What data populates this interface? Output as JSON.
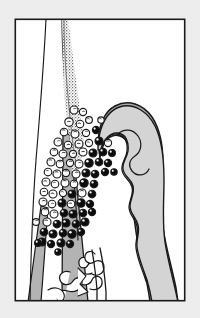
{
  "figure": {
    "type": "scientific-illustration",
    "subtype": "histology-schematic",
    "title": "",
    "caption": "",
    "canvas": {
      "width": 200,
      "height": 318
    },
    "background_color": "#ededed",
    "frame": {
      "name": "figure-border",
      "x": 14.5,
      "y": 18.5,
      "width": 171,
      "height": 283,
      "stroke_color": "#1a1a1a",
      "stroke_width": 1.6,
      "fill_color": "#ffffff"
    },
    "palette": {
      "background": "#ededed",
      "panel_fill": "#ffffff",
      "tissue_light_gray": "#d4d4d4",
      "tissue_mid_gray": "#a9a9a9",
      "tissue_band_gray": "#b3b3b3",
      "outline_dark": "#1a1a1a",
      "cell_dark_fill": "#0d0d0d",
      "cell_open_fill": "#ffffff",
      "cell_highlight": "#ffffff",
      "stipple_color": "#4a4a4a"
    },
    "structures": [
      {
        "name": "epithelial-margin-line-outer",
        "kind": "thin-curve",
        "description": "slender near-vertical boundary line at upper left",
        "stroke_color": "#1a1a1a",
        "stroke_width": 1.1
      },
      {
        "name": "epithelial-margin-line-inner",
        "kind": "thin-curve",
        "description": "second slender boundary line running parallel, slightly right",
        "stroke_color": "#1a1a1a",
        "stroke_width": 1.1
      },
      {
        "name": "stippled-basement-band",
        "kind": "stippled-band",
        "description": "granular stippled diagonal band descending from top to mid-left",
        "color": "#4a4a4a"
      },
      {
        "name": "gray-stromal-band-left",
        "kind": "filled-band",
        "description": "mid-gray band continuing downward along the left toward panel base",
        "fill_color": "#b3b3b3"
      },
      {
        "name": "tissue-mass-outer-zone",
        "kind": "filled-region",
        "description": "dark gray outer rim of the large right-hand tissue mass",
        "fill_color": "#a9a9a9"
      },
      {
        "name": "tissue-mass-inner-zone",
        "kind": "filled-region",
        "description": "light gray scalloped inner core of the tissue mass",
        "fill_color": "#d4d4d4"
      },
      {
        "name": "basal-branching-structure",
        "kind": "outline-network",
        "description": "irregular branching outlined network at panel base",
        "stroke_color": "#1a1a1a",
        "fill_color": "#ffffff"
      }
    ],
    "cell_legend": [
      {
        "key": "open-cell",
        "label": "unlabelled / open cell",
        "fill": "#ffffff",
        "ring": "#1a1a1a"
      },
      {
        "key": "dark-cell",
        "label": "labelled / dense cell",
        "fill": "#0d0d0d",
        "ring": "#000000"
      }
    ],
    "cell_counts": {
      "open_cells": 40,
      "dark_cells": 38,
      "total": 78
    },
    "cells": [
      {
        "x": 74,
        "y": 110,
        "r": 4.0,
        "type": "open"
      },
      {
        "x": 83,
        "y": 112,
        "r": 3.6,
        "type": "open"
      },
      {
        "x": 69,
        "y": 122,
        "r": 4.2,
        "type": "open"
      },
      {
        "x": 80,
        "y": 124,
        "r": 3.8,
        "type": "open"
      },
      {
        "x": 89,
        "y": 120,
        "r": 3.4,
        "type": "open"
      },
      {
        "x": 64,
        "y": 132,
        "r": 3.8,
        "type": "open"
      },
      {
        "x": 75,
        "y": 134,
        "r": 4.0,
        "type": "open"
      },
      {
        "x": 86,
        "y": 133,
        "r": 3.6,
        "type": "open"
      },
      {
        "x": 58,
        "y": 142,
        "r": 4.0,
        "type": "open"
      },
      {
        "x": 68,
        "y": 145,
        "r": 3.8,
        "type": "open"
      },
      {
        "x": 79,
        "y": 144,
        "r": 4.0,
        "type": "open"
      },
      {
        "x": 89,
        "y": 143,
        "r": 3.6,
        "type": "open"
      },
      {
        "x": 99,
        "y": 141,
        "r": 4.0,
        "type": "dark"
      },
      {
        "x": 108,
        "y": 143,
        "r": 3.6,
        "type": "open"
      },
      {
        "x": 54,
        "y": 152,
        "r": 3.8,
        "type": "open"
      },
      {
        "x": 63,
        "y": 154,
        "r": 4.0,
        "type": "open"
      },
      {
        "x": 73,
        "y": 154,
        "r": 3.6,
        "type": "open"
      },
      {
        "x": 83,
        "y": 152,
        "r": 4.0,
        "type": "open"
      },
      {
        "x": 93,
        "y": 153,
        "r": 4.0,
        "type": "dark"
      },
      {
        "x": 103,
        "y": 152,
        "r": 3.8,
        "type": "dark"
      },
      {
        "x": 51,
        "y": 162,
        "r": 4.0,
        "type": "open"
      },
      {
        "x": 60,
        "y": 164,
        "r": 3.8,
        "type": "open"
      },
      {
        "x": 70,
        "y": 163,
        "r": 3.6,
        "type": "open"
      },
      {
        "x": 79,
        "y": 164,
        "r": 4.0,
        "type": "open"
      },
      {
        "x": 89,
        "y": 163,
        "r": 4.2,
        "type": "dark"
      },
      {
        "x": 99,
        "y": 162,
        "r": 3.8,
        "type": "dark"
      },
      {
        "x": 108,
        "y": 163,
        "r": 3.6,
        "type": "dark"
      },
      {
        "x": 48,
        "y": 172,
        "r": 3.8,
        "type": "open"
      },
      {
        "x": 57,
        "y": 174,
        "r": 4.0,
        "type": "open"
      },
      {
        "x": 66,
        "y": 173,
        "r": 3.6,
        "type": "open"
      },
      {
        "x": 76,
        "y": 174,
        "r": 4.0,
        "type": "open"
      },
      {
        "x": 86,
        "y": 173,
        "r": 4.0,
        "type": "dark"
      },
      {
        "x": 95,
        "y": 174,
        "r": 3.8,
        "type": "dark"
      },
      {
        "x": 105,
        "y": 172,
        "r": 3.6,
        "type": "dark"
      },
      {
        "x": 46,
        "y": 182,
        "r": 4.0,
        "type": "open"
      },
      {
        "x": 55,
        "y": 184,
        "r": 3.8,
        "type": "open"
      },
      {
        "x": 65,
        "y": 183,
        "r": 4.0,
        "type": "open"
      },
      {
        "x": 74,
        "y": 184,
        "r": 3.8,
        "type": "open"
      },
      {
        "x": 84,
        "y": 183,
        "r": 4.2,
        "type": "dark"
      },
      {
        "x": 94,
        "y": 184,
        "r": 3.8,
        "type": "dark"
      },
      {
        "x": 44,
        "y": 192,
        "r": 3.8,
        "type": "open"
      },
      {
        "x": 53,
        "y": 194,
        "r": 4.0,
        "type": "open"
      },
      {
        "x": 63,
        "y": 193,
        "r": 3.6,
        "type": "open"
      },
      {
        "x": 72,
        "y": 194,
        "r": 4.0,
        "type": "dark"
      },
      {
        "x": 82,
        "y": 193,
        "r": 4.0,
        "type": "open"
      },
      {
        "x": 92,
        "y": 194,
        "r": 3.8,
        "type": "dark"
      },
      {
        "x": 43,
        "y": 202,
        "r": 4.0,
        "type": "open"
      },
      {
        "x": 52,
        "y": 204,
        "r": 3.8,
        "type": "open"
      },
      {
        "x": 62,
        "y": 203,
        "r": 4.0,
        "type": "dark"
      },
      {
        "x": 71,
        "y": 204,
        "r": 3.8,
        "type": "open"
      },
      {
        "x": 81,
        "y": 203,
        "r": 4.2,
        "type": "dark"
      },
      {
        "x": 90,
        "y": 204,
        "r": 3.6,
        "type": "dark"
      },
      {
        "x": 45,
        "y": 212,
        "r": 3.8,
        "type": "open"
      },
      {
        "x": 54,
        "y": 214,
        "r": 4.0,
        "type": "open"
      },
      {
        "x": 64,
        "y": 213,
        "r": 3.8,
        "type": "dark"
      },
      {
        "x": 73,
        "y": 214,
        "r": 4.0,
        "type": "dark"
      },
      {
        "x": 83,
        "y": 213,
        "r": 3.8,
        "type": "dark"
      },
      {
        "x": 92,
        "y": 212,
        "r": 3.6,
        "type": "dark"
      },
      {
        "x": 47,
        "y": 222,
        "r": 4.0,
        "type": "open"
      },
      {
        "x": 57,
        "y": 224,
        "r": 3.8,
        "type": "dark"
      },
      {
        "x": 66,
        "y": 223,
        "r": 4.0,
        "type": "dark"
      },
      {
        "x": 76,
        "y": 224,
        "r": 3.8,
        "type": "dark"
      },
      {
        "x": 85,
        "y": 222,
        "r": 4.0,
        "type": "dark"
      },
      {
        "x": 44,
        "y": 232,
        "r": 3.8,
        "type": "dark"
      },
      {
        "x": 53,
        "y": 234,
        "r": 4.0,
        "type": "dark"
      },
      {
        "x": 63,
        "y": 233,
        "r": 3.8,
        "type": "dark"
      },
      {
        "x": 72,
        "y": 234,
        "r": 4.2,
        "type": "dark"
      },
      {
        "x": 81,
        "y": 232,
        "r": 3.6,
        "type": "dark"
      },
      {
        "x": 42,
        "y": 242,
        "r": 4.0,
        "type": "dark"
      },
      {
        "x": 51,
        "y": 244,
        "r": 3.6,
        "type": "dark"
      },
      {
        "x": 61,
        "y": 243,
        "r": 4.0,
        "type": "dark"
      },
      {
        "x": 70,
        "y": 244,
        "r": 3.6,
        "type": "dark"
      },
      {
        "x": 96,
        "y": 130,
        "r": 3.6,
        "type": "dark"
      },
      {
        "x": 101,
        "y": 120,
        "r": 3.2,
        "type": "open"
      },
      {
        "x": 112,
        "y": 153,
        "r": 3.4,
        "type": "dark"
      },
      {
        "x": 114,
        "y": 172,
        "r": 3.2,
        "type": "dark"
      },
      {
        "x": 36,
        "y": 222,
        "r": 3.4,
        "type": "open"
      },
      {
        "x": 38,
        "y": 243,
        "r": 3.4,
        "type": "dark"
      },
      {
        "x": 58,
        "y": 252,
        "r": 3.2,
        "type": "dark"
      }
    ]
  }
}
